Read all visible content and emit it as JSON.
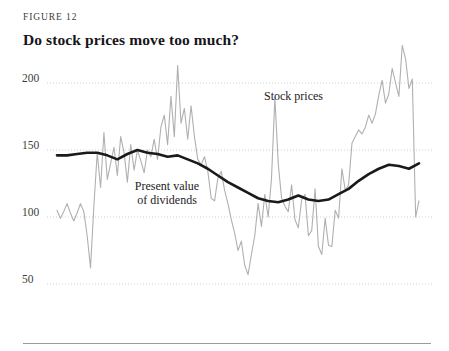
{
  "figure": {
    "label": "FIGURE 12",
    "title": "Do stock prices move too much?"
  },
  "annotations": {
    "stock_prices": "Stock prices",
    "present_value_line1": "Present value",
    "present_value_line2": "of dividends"
  },
  "colors": {
    "stock_prices_line": "#b0b0b0",
    "present_value_line": "#1a1a1a",
    "gridline": "#cfcfcf",
    "text": "#231f20",
    "rule": "#9a9a9a",
    "background": "#ffffff"
  },
  "chart_data": {
    "type": "line",
    "title": "Do stock prices move too much?",
    "subtitle": "FIGURE 12",
    "xlabel": "",
    "ylabel": "",
    "ylim": [
      30,
      235
    ],
    "xlim": [
      0,
      108
    ],
    "grid": true,
    "grid_axis": "y",
    "legend": "inline-annotations",
    "yticks": [
      50,
      100,
      150,
      200
    ],
    "ytick_labels": [
      "50",
      "100",
      "150",
      "200"
    ],
    "xticks": [],
    "xtick_labels": [],
    "series": [
      {
        "name": "Stock prices",
        "color": "#b0b0b0",
        "width": 1.1,
        "x": [
          0,
          1,
          2,
          3,
          4,
          5,
          6,
          7,
          8,
          9,
          10,
          11,
          12,
          13,
          14,
          15,
          16,
          17,
          18,
          19,
          20,
          21,
          22,
          23,
          24,
          25,
          26,
          27,
          28,
          29,
          30,
          31,
          32,
          33,
          34,
          35,
          36,
          37,
          38,
          39,
          40,
          41,
          42,
          43,
          44,
          45,
          46,
          47,
          48,
          49,
          50,
          51,
          52,
          53,
          54,
          55,
          56,
          57,
          58,
          59,
          60,
          61,
          62,
          63,
          64,
          65,
          66,
          67,
          68,
          69,
          70,
          71,
          72,
          73,
          74,
          75,
          76,
          77,
          78,
          79,
          80,
          81,
          82,
          83,
          84,
          85,
          86,
          87,
          88,
          89,
          90,
          91,
          92,
          93,
          94,
          95,
          96,
          97,
          98,
          99,
          100,
          101,
          102,
          103,
          104,
          105,
          106,
          107,
          108
        ],
        "values": [
          105,
          99,
          104,
          110,
          103,
          97,
          103,
          110,
          104,
          86,
          62,
          108,
          148,
          122,
          163,
          128,
          140,
          152,
          131,
          160,
          148,
          126,
          154,
          135,
          150,
          142,
          133,
          150,
          145,
          158,
          143,
          167,
          176,
          154,
          190,
          160,
          213,
          170,
          181,
          158,
          183,
          160,
          143,
          139,
          145,
          134,
          114,
          112,
          129,
          134,
          120,
          110,
          98,
          88,
          75,
          82,
          64,
          57,
          72,
          86,
          110,
          93,
          117,
          100,
          129,
          189,
          140,
          114,
          108,
          104,
          124,
          98,
          92,
          113,
          117,
          86,
          90,
          121,
          78,
          72,
          99,
          79,
          78,
          105,
          99,
          136,
          120,
          124,
          155,
          160,
          165,
          162,
          167,
          176,
          170,
          177,
          191,
          202,
          185,
          192,
          211,
          200,
          190,
          228,
          218,
          196,
          203,
          100,
          112
        ]
      },
      {
        "name": "Present value of dividends",
        "color": "#1a1a1a",
        "width": 2.6,
        "x": [
          0,
          3,
          6,
          9,
          12,
          15,
          18,
          21,
          24,
          27,
          30,
          33,
          36,
          39,
          42,
          45,
          48,
          51,
          54,
          57,
          60,
          63,
          66,
          69,
          72,
          75,
          78,
          81,
          84,
          87,
          90,
          93,
          96,
          99,
          102,
          105,
          108
        ],
        "values": [
          146,
          146,
          147,
          148,
          148,
          146,
          143,
          147,
          150,
          148,
          147,
          145,
          146,
          143,
          140,
          136,
          131,
          126,
          122,
          118,
          114,
          112,
          111,
          113,
          116,
          113,
          112,
          113,
          117,
          121,
          127,
          132,
          136,
          139,
          138,
          136,
          140
        ]
      }
    ]
  }
}
